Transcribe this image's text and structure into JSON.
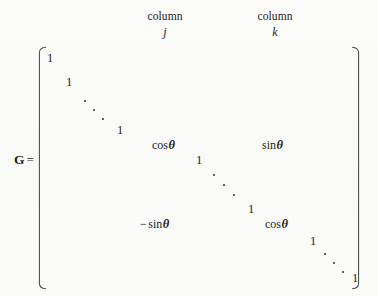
{
  "figure": {
    "kind": "givens-rotation-matrix",
    "background_color": "#fbfbfa",
    "ink_color": "#262422"
  },
  "annotations": {
    "column_j": {
      "word": "column",
      "index": "j"
    },
    "column_k": {
      "word": "column",
      "index": "k"
    }
  },
  "equation": {
    "matrix_symbol": "G",
    "equals": "="
  },
  "brackets": {
    "left": "[",
    "right": "]"
  },
  "entries": [
    {
      "name": "one-1",
      "text": "1"
    },
    {
      "name": "one-2",
      "text": "1"
    },
    {
      "name": "one-3",
      "text": "1"
    },
    {
      "name": "cos-theta-jj",
      "prefix": "cos",
      "symbol": "θ"
    },
    {
      "name": "sin-theta-jk",
      "prefix": "sin",
      "symbol": "θ"
    },
    {
      "name": "one-4",
      "text": "1"
    },
    {
      "name": "one-5",
      "text": "1"
    },
    {
      "name": "neg-sin-theta-kj",
      "minus": "−",
      "prefix": "sin",
      "symbol": "θ"
    },
    {
      "name": "cos-theta-kk",
      "prefix": "cos",
      "symbol": "θ"
    },
    {
      "name": "one-6",
      "text": "1"
    },
    {
      "name": "one-7",
      "text": "1"
    }
  ],
  "cells": {
    "one_1": "1",
    "one_2": "1",
    "one_3": "1",
    "one_4": "1",
    "one_5": "1",
    "one_6": "1",
    "one_7": "1",
    "cos_label": "cos",
    "sin_label": "sin",
    "theta": "θ",
    "minus": "−"
  },
  "ellipses": [
    {
      "name": "ddots-upper-left",
      "glyph": "⋱"
    },
    {
      "name": "ddots-middle",
      "glyph": "⋱"
    },
    {
      "name": "ddots-lower-right",
      "glyph": "⋱"
    }
  ]
}
